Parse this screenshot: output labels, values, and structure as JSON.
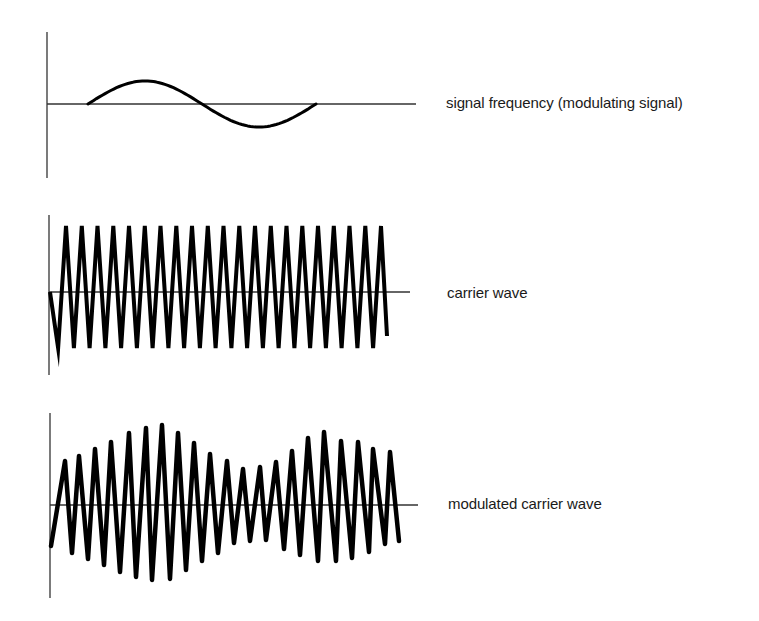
{
  "diagram": {
    "colors": {
      "background": "#ffffff",
      "axis": "#333333",
      "wave": "#000000",
      "text": "#1a1a1a"
    },
    "panels": [
      {
        "id": "signal",
        "label": "signal frequency (modulating signal)",
        "axis": {
          "x": 47,
          "yTop": 32,
          "yBottom": 178,
          "baselineY": 104,
          "baselineX2": 416
        },
        "wave": {
          "type": "sine",
          "x0": 88,
          "x1": 316,
          "cycles": 1,
          "amplitude": 23,
          "strokeWidth": 3
        }
      },
      {
        "id": "carrier",
        "label": "carrier wave",
        "axis": {
          "x": 49,
          "yTop": 215,
          "yBottom": 375,
          "baselineY": 292,
          "baselineX2": 410
        },
        "wave": {
          "type": "triangle",
          "x0": 50,
          "x1": 387,
          "firstPeakX": 66,
          "period": 15.75,
          "peaks": 21,
          "topY": 226,
          "bottomY": 348,
          "endY": 336,
          "strokeWidth": 4
        }
      },
      {
        "id": "modulated",
        "label": "modulated carrier wave",
        "axis": {
          "x": 50,
          "yTop": 413,
          "yBottom": 598,
          "baselineY": 505,
          "baselineX2": 418
        },
        "wave": {
          "type": "modulated-triangle",
          "startX": 51,
          "startY": 546,
          "endX": 399,
          "endY": 541,
          "strokeWidth": 4.5,
          "peaks": [
            [
              65,
              461
            ],
            [
              79,
              456
            ],
            [
              95,
              449
            ],
            [
              111,
              442
            ],
            [
              129,
              433
            ],
            [
              146,
              428
            ],
            [
              162,
              425
            ],
            [
              178,
              433
            ],
            [
              194,
              443
            ],
            [
              210,
              454
            ],
            [
              227,
              461
            ],
            [
              243,
              469
            ],
            [
              260,
              467
            ],
            [
              276,
              462
            ],
            [
              292,
              451
            ],
            [
              308,
              438
            ],
            [
              324,
              432
            ],
            [
              341,
              441
            ],
            [
              358,
              442
            ],
            [
              373,
              449
            ],
            [
              390,
              452
            ]
          ],
          "troughs": [
            [
              72,
              553
            ],
            [
              88,
              559
            ],
            [
              104,
              565
            ],
            [
              120,
              572
            ],
            [
              136,
              577
            ],
            [
              152,
              580
            ],
            [
              170,
              579
            ],
            [
              186,
              570
            ],
            [
              202,
              561
            ],
            [
              218,
              553
            ],
            [
              234,
              543
            ],
            [
              250,
              541
            ],
            [
              266,
              540
            ],
            [
              284,
              549
            ],
            [
              300,
              555
            ],
            [
              318,
              561
            ],
            [
              336,
              561
            ],
            [
              352,
              558
            ],
            [
              369,
              552
            ],
            [
              385,
              544
            ]
          ]
        }
      }
    ]
  }
}
